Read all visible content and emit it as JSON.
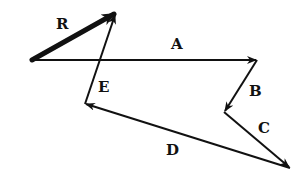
{
  "diagram": {
    "type": "vector-addition",
    "stroke_color": "#111111",
    "vectors": [
      {
        "label": "R",
        "from": [
          32,
          60
        ],
        "to": [
          116,
          13
        ],
        "thick": true
      },
      {
        "label": "A",
        "from": [
          32,
          60
        ],
        "to": [
          257,
          60
        ],
        "thick": false
      },
      {
        "label": "B",
        "from": [
          257,
          60
        ],
        "to": [
          224,
          112
        ],
        "thick": false
      },
      {
        "label": "C",
        "from": [
          224,
          112
        ],
        "to": [
          290,
          168
        ],
        "thick": false
      },
      {
        "label": "D",
        "from": [
          290,
          168
        ],
        "to": [
          85,
          104
        ],
        "thick": false
      },
      {
        "label": "E",
        "from": [
          85,
          104
        ],
        "to": [
          116,
          13
        ],
        "thick": false
      }
    ],
    "labels": {
      "R": "R",
      "A": "A",
      "B": "B",
      "C": "C",
      "D": "D",
      "E": "E"
    }
  }
}
